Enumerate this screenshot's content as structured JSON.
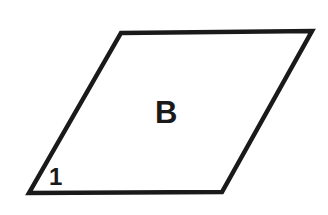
{
  "figure": {
    "type": "parallelogram",
    "background_color": "#ffffff",
    "stroke_color": "#1a1a1a",
    "fill_color": "#ffffff",
    "stroke_width": 4.5,
    "canvas": {
      "width": 328,
      "height": 215
    },
    "vertices": [
      {
        "name": "top-left",
        "x": 121,
        "y": 33
      },
      {
        "name": "top-right",
        "x": 312,
        "y": 31
      },
      {
        "name": "bottom-right",
        "x": 222,
        "y": 192
      },
      {
        "name": "bottom-left",
        "x": 29,
        "y": 193
      }
    ],
    "points_attr": "121,33 312,31 222,192 29,193",
    "labels": {
      "region": "B",
      "angle": "1"
    }
  }
}
